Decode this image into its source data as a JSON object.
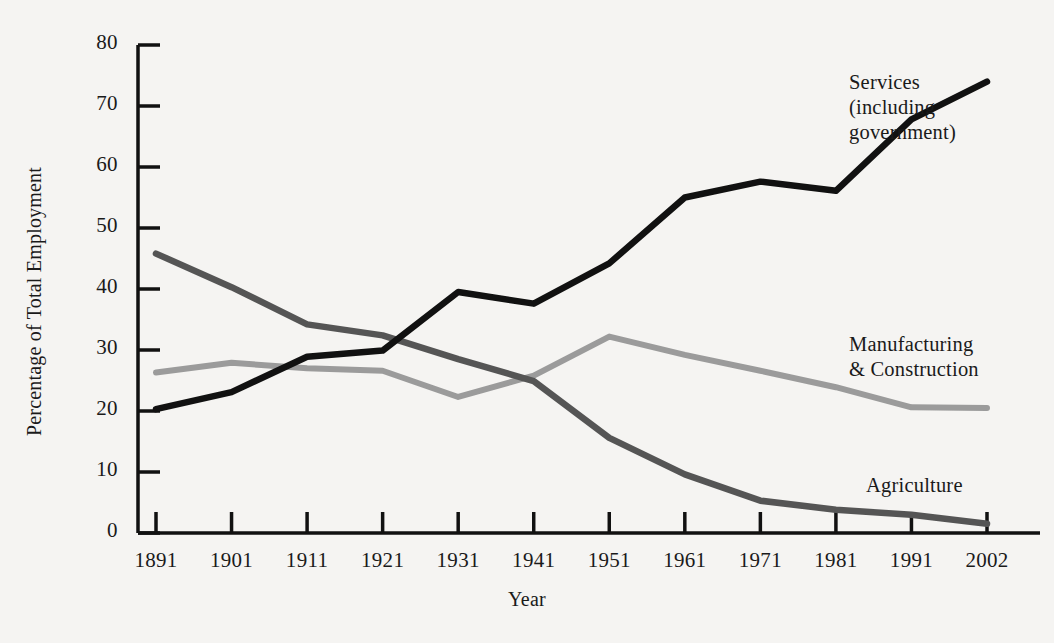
{
  "chart_data": {
    "type": "line",
    "title": "",
    "xlabel": "Year",
    "ylabel": "Percentage of Total Employment",
    "categories": [
      "1891",
      "1901",
      "1911",
      "1921",
      "1931",
      "1941",
      "1951",
      "1961",
      "1971",
      "1981",
      "1991",
      "2002"
    ],
    "x": [
      1891,
      1901,
      1911,
      1921,
      1931,
      1941,
      1951,
      1961,
      1971,
      1981,
      1991,
      2002
    ],
    "xtick_labels": [
      "1891",
      "1901",
      "1911",
      "1921",
      "1931",
      "1941",
      "1951",
      "1961",
      "1971",
      "1981",
      "1991",
      "2002"
    ],
    "ytick_labels": [
      "0",
      "10",
      "20",
      "30",
      "40",
      "50",
      "60",
      "70",
      "80"
    ],
    "yticks": [
      0,
      10,
      20,
      30,
      40,
      50,
      60,
      70,
      80
    ],
    "ylim": [
      0,
      80
    ],
    "grid": false,
    "legend_position": "inline-annotations",
    "series": [
      {
        "name": "Services (including government)",
        "label_text": "Services\n(including\ngovernment)",
        "color": "#111111",
        "values": [
          20.3,
          23.1,
          28.9,
          29.9,
          39.5,
          37.6,
          44.2,
          55.0,
          57.6,
          56.1,
          67.8,
          74.0
        ]
      },
      {
        "name": "Manufacturing & Construction",
        "label_text": "Manufacturing\n& Construction",
        "color": "#9b9b9b",
        "values": [
          26.3,
          27.9,
          27.0,
          26.6,
          22.3,
          25.8,
          32.2,
          29.2,
          26.6,
          23.9,
          20.6,
          20.5
        ]
      },
      {
        "name": "Agriculture",
        "label_text": "Agriculture",
        "color": "#555555",
        "values": [
          45.8,
          40.3,
          34.2,
          32.4,
          28.5,
          24.9,
          15.6,
          9.6,
          5.3,
          3.8,
          3.0,
          1.5
        ]
      }
    ]
  },
  "axes": {
    "y_axis_title": "Percentage of Total Employment",
    "x_axis_title": "Year"
  },
  "annotations": {
    "services": "Services\n(including\ngovernment)",
    "manufacturing": "Manufacturing\n& Construction",
    "agriculture": "Agriculture"
  },
  "colors": {
    "background": "#f5f4f2",
    "axis": "#111111",
    "services": "#111111",
    "manufacturing": "#9b9b9b",
    "agriculture": "#555555"
  }
}
